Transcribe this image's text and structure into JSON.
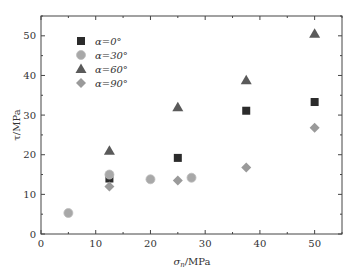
{
  "chart_data": {
    "type": "scatter",
    "title": "",
    "xlabel": "σn/MPa",
    "ylabel": "τ/MPa",
    "xlim": [
      0,
      55
    ],
    "ylim": [
      0,
      55
    ],
    "xticks": [
      0,
      10,
      20,
      30,
      40,
      50
    ],
    "yticks": [
      0,
      10,
      20,
      30,
      40,
      50
    ],
    "grid": false,
    "legend_position": "upper left",
    "series": [
      {
        "name": "α=0°",
        "marker": "square",
        "color": "#2b2b2b",
        "x": [
          12.5,
          25,
          37.5,
          50
        ],
        "y": [
          14.0,
          19.2,
          31.1,
          33.3
        ]
      },
      {
        "name": "α=30°",
        "marker": "circle",
        "color": "#a8a8a8",
        "x": [
          5,
          12.5,
          20,
          27.5
        ],
        "y": [
          5.3,
          15.0,
          13.8,
          14.2
        ]
      },
      {
        "name": "α=60°",
        "marker": "triangle",
        "color": "#5a5a5a",
        "x": [
          12.5,
          25,
          37.5,
          50
        ],
        "y": [
          21.0,
          32.0,
          38.8,
          50.5
        ]
      },
      {
        "name": "α=90°",
        "marker": "diamond",
        "color": "#9a9a9a",
        "x": [
          12.5,
          25,
          37.5,
          50
        ],
        "y": [
          12.0,
          13.5,
          16.8,
          26.8
        ]
      }
    ]
  },
  "labels": {
    "xlabel_main": "σ",
    "xlabel_sub": "n",
    "xlabel_unit": "/MPa",
    "ylabel": "τ/MPa"
  },
  "legend": [
    {
      "label": "α=0°"
    },
    {
      "label": "α=30°"
    },
    {
      "label": "α=60°"
    },
    {
      "label": "α=90°"
    }
  ]
}
